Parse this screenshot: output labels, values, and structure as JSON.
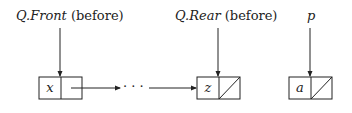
{
  "labels": {
    "front": {
      "var": "Q.",
      "field": "Front",
      "suffix": " (before)"
    },
    "rear": {
      "var": "Q.",
      "field": "Rear",
      "suffix": " (before)"
    },
    "p": {
      "var": "p"
    }
  },
  "nodes": [
    {
      "value": "x",
      "next": "pointer"
    },
    {
      "value": "z",
      "next": "null"
    },
    {
      "value": "a",
      "next": "null"
    }
  ],
  "ellipsis": "· · ·"
}
